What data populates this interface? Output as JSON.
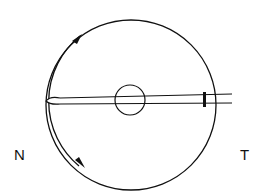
{
  "diagram": {
    "labels": {
      "left": "N",
      "right": "T"
    },
    "colors": {
      "stroke": "#111111",
      "background": "#ffffff"
    }
  }
}
